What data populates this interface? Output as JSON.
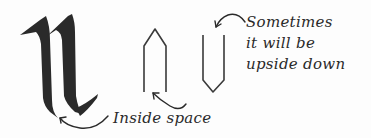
{
  "diagram": {
    "letter": "n",
    "letter_style": "blackletter",
    "shapes": [
      {
        "name": "pointed-arch",
        "orientation": "upright"
      },
      {
        "name": "pointed-arch",
        "orientation": "upside-down"
      }
    ],
    "labels": {
      "inside_space": "Inside space",
      "upside_down_lines": [
        "Sometimes",
        "it will be",
        "upside down"
      ]
    },
    "colors": {
      "ink": "#2a2a2a",
      "background": "#fdfdfd"
    }
  }
}
